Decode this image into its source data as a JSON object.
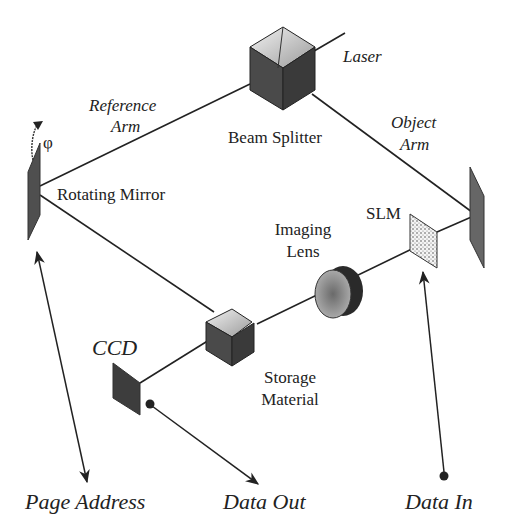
{
  "diagram": {
    "components": {
      "laser": {
        "label": "Laser"
      },
      "beam_splitter": {
        "label": "Beam Splitter"
      },
      "reference_arm": {
        "label_line1": "Reference",
        "label_line2": "Arm"
      },
      "object_arm": {
        "label_line1": "Object",
        "label_line2": "Arm"
      },
      "rotating_mirror": {
        "label": "Rotating Mirror",
        "angle_symbol": "φ"
      },
      "slm": {
        "label": "SLM"
      },
      "imaging_lens": {
        "label_line1": "Imaging",
        "label_line2": "Lens"
      },
      "storage_material": {
        "label_line1": "Storage",
        "label_line2": "Material"
      },
      "ccd": {
        "label": "CCD"
      }
    },
    "io_labels": {
      "page_address": "Page Address",
      "data_out": "Data Out",
      "data_in": "Data In"
    },
    "colors": {
      "line": "#222222",
      "dark_face": "#3a3a3a",
      "mid_face": "#555555",
      "light_face": "#d8d8d8",
      "mirror": "#5a5a5a"
    }
  }
}
